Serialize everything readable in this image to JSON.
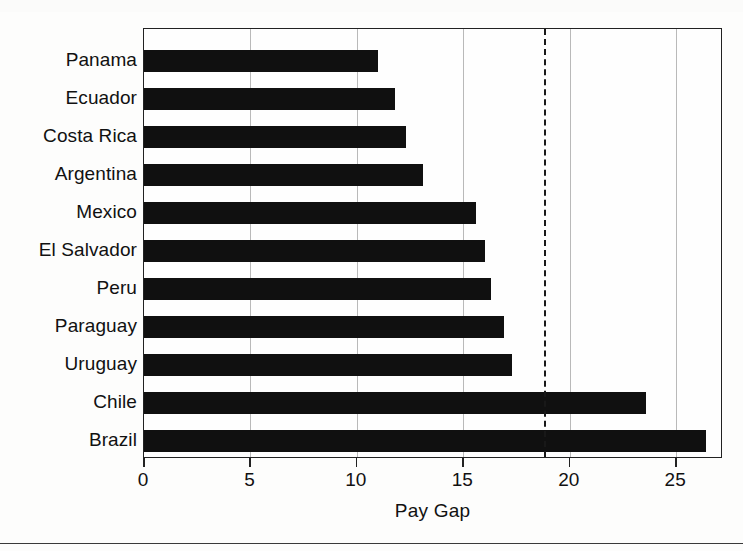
{
  "chart_data": {
    "type": "bar",
    "orientation": "horizontal",
    "title": "",
    "xlabel": "Pay Gap",
    "ylabel": "",
    "xlim": [
      0,
      27.2
    ],
    "ylim": null,
    "grid": "vertical gridlines at x ticks",
    "legend": null,
    "categories": [
      "Panama",
      "Ecuador",
      "Costa Rica",
      "Argentina",
      "Mexico",
      "El Salvador",
      "Peru",
      "Paraguay",
      "Uruguay",
      "Chile",
      "Brazil"
    ],
    "values": [
      11.0,
      11.8,
      12.3,
      13.1,
      15.6,
      16.0,
      16.3,
      16.9,
      17.3,
      23.6,
      26.4
    ],
    "xticks": [
      0,
      5,
      10,
      15,
      20,
      25
    ],
    "xtick_labels": [
      "0",
      "5",
      "10",
      "15",
      "20",
      "25"
    ],
    "annotations": [
      {
        "name": "threshold-dashed-line",
        "type": "vertical-dashed-line",
        "value": 18.8,
        "label": ""
      }
    ],
    "bar_color": "#101010",
    "gridline_color": "#b9b9b9",
    "axis_color": "#222222",
    "background_color": "#fefefe"
  }
}
